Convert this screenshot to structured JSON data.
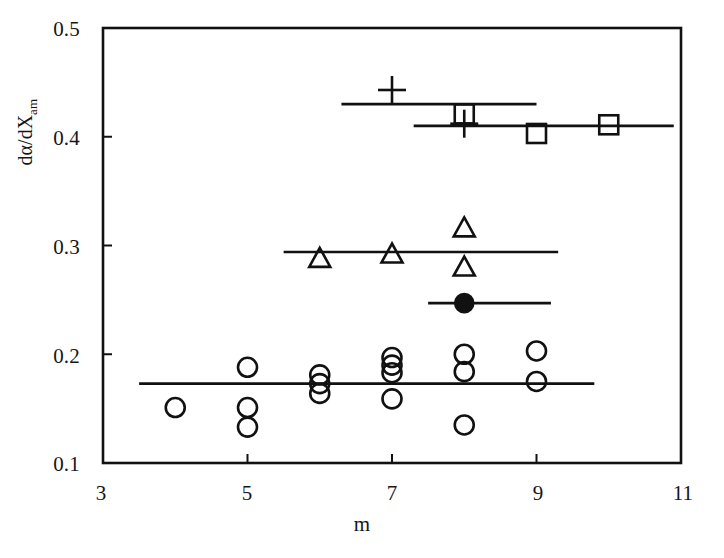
{
  "chart_data": {
    "type": "scatter",
    "title": "",
    "xlabel": "m",
    "ylabel": "da/dX",
    "ylabel_parts": {
      "main": "dα/dX",
      "subscript": "am"
    },
    "xlim": [
      3,
      11
    ],
    "ylim": [
      0.1,
      0.5
    ],
    "xticks": [
      3,
      5,
      7,
      9,
      11
    ],
    "xtick_labels": [
      "3",
      "5",
      "7",
      "9",
      "11"
    ],
    "yticks": [
      0.1,
      0.2,
      0.3,
      0.4,
      0.5
    ],
    "ytick_labels": [
      "0.1",
      "0.2",
      "0.3",
      "0.4",
      "0.5"
    ],
    "grid": false,
    "legend": "none",
    "marker_color": "#111111",
    "line_color": "#111111",
    "background": "#ffffff",
    "series": [
      {
        "name": "open-circle",
        "marker": "circle-open",
        "points": [
          {
            "x": 4.0,
            "y": 0.151
          },
          {
            "x": 5.0,
            "y": 0.188
          },
          {
            "x": 5.0,
            "y": 0.151
          },
          {
            "x": 5.0,
            "y": 0.133
          },
          {
            "x": 6.0,
            "y": 0.181
          },
          {
            "x": 6.0,
            "y": 0.173
          },
          {
            "x": 6.0,
            "y": 0.164
          },
          {
            "x": 7.0,
            "y": 0.197
          },
          {
            "x": 7.0,
            "y": 0.19
          },
          {
            "x": 7.0,
            "y": 0.183
          },
          {
            "x": 7.0,
            "y": 0.159
          },
          {
            "x": 8.0,
            "y": 0.2
          },
          {
            "x": 8.0,
            "y": 0.184
          },
          {
            "x": 8.0,
            "y": 0.135
          },
          {
            "x": 9.0,
            "y": 0.203
          },
          {
            "x": 9.0,
            "y": 0.175
          }
        ]
      },
      {
        "name": "open-triangle",
        "marker": "triangle-open",
        "points": [
          {
            "x": 6.0,
            "y": 0.287
          },
          {
            "x": 7.0,
            "y": 0.291
          },
          {
            "x": 8.0,
            "y": 0.315
          },
          {
            "x": 8.0,
            "y": 0.279
          }
        ]
      },
      {
        "name": "filled-circle",
        "marker": "circle-filled",
        "points": [
          {
            "x": 8.0,
            "y": 0.247
          }
        ]
      },
      {
        "name": "open-square",
        "marker": "square-open",
        "points": [
          {
            "x": 8.0,
            "y": 0.421
          },
          {
            "x": 9.0,
            "y": 0.403
          },
          {
            "x": 10.0,
            "y": 0.411
          }
        ]
      },
      {
        "name": "plus",
        "marker": "plus",
        "points": [
          {
            "x": 7.0,
            "y": 0.443
          },
          {
            "x": 8.0,
            "y": 0.412
          }
        ]
      }
    ],
    "trend_lines": [
      {
        "name": "plus-trend",
        "y": 0.43,
        "x_start": 6.3,
        "x_end": 9.0
      },
      {
        "name": "square-trend",
        "y": 0.41,
        "x_start": 7.3,
        "x_end": 10.9
      },
      {
        "name": "triangle-trend",
        "y": 0.294,
        "x_start": 5.5,
        "x_end": 9.3
      },
      {
        "name": "filled-circle-trend",
        "y": 0.247,
        "x_start": 7.5,
        "x_end": 9.2
      },
      {
        "name": "circle-trend",
        "y": 0.173,
        "x_start": 3.5,
        "x_end": 9.8
      }
    ]
  },
  "axes": {
    "frame_color": "#111111",
    "x_axis_name": "m",
    "y_axis_name": "dalpha-dX-am"
  }
}
